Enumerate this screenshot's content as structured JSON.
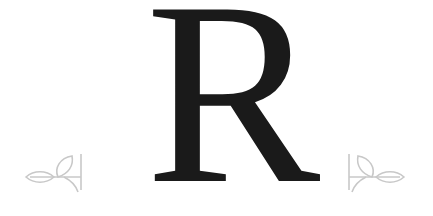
{
  "logo": {
    "letter": "R",
    "letter_color": "#1a1a1a",
    "ornament_color": "#c8c8c8",
    "ornaments": [
      {
        "position": "left",
        "icon": "leaf-sprig-icon"
      },
      {
        "position": "right",
        "icon": "leaf-sprig-icon"
      }
    ]
  }
}
